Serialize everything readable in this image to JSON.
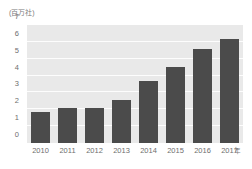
{
  "chart_data": {
    "type": "bar",
    "title": "",
    "subtitle": "",
    "unit_label": "(百万社)",
    "xlabel": "年",
    "ylabel": "",
    "categories": [
      "2010",
      "2011",
      "2012",
      "2013",
      "2014",
      "2015",
      "2016",
      "2017"
    ],
    "values": [
      1.85,
      2.1,
      2.05,
      2.55,
      3.7,
      4.5,
      5.6,
      6.15
    ],
    "series": [
      {
        "name": "企業数",
        "values": [
          1.85,
          2.1,
          2.05,
          2.55,
          3.7,
          4.5,
          5.6,
          6.15
        ]
      }
    ],
    "ylim": [
      0,
      7
    ],
    "ytick_labels": [
      "0",
      "1",
      "2",
      "3",
      "4",
      "5",
      "6",
      "7"
    ],
    "ytick_values": [
      0,
      1,
      2,
      3,
      4,
      5,
      6,
      7
    ],
    "grid": true,
    "grid_axis": "y",
    "legend": false,
    "legend_position": "none",
    "colors": {
      "bar": "#4b4b4b",
      "plot_background": "#e9e9e9",
      "gridline": "#fdfdfd",
      "page_background": "#ffffff",
      "tick_text": "#6e6e6e"
    }
  }
}
